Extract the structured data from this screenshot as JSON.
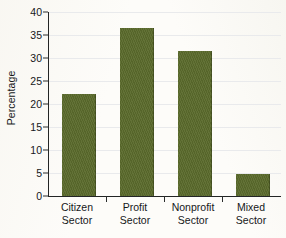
{
  "chart_data": {
    "type": "bar",
    "title": "",
    "xlabel": "",
    "ylabel": "Percentage",
    "categories": [
      "Citizen Sector",
      "Profit Sector",
      "Nonprofit Sector",
      "Mixed Sector"
    ],
    "category_lines": [
      [
        "Citizen",
        "Sector"
      ],
      [
        "Profit",
        "Sector"
      ],
      [
        "Nonprofit",
        "Sector"
      ],
      [
        "Mixed",
        "Sector"
      ]
    ],
    "values": [
      22.2,
      36.5,
      31.6,
      4.8
    ],
    "ylim": [
      0,
      40
    ],
    "ytick_values": [
      0,
      5,
      10,
      15,
      20,
      25,
      30,
      35,
      40
    ],
    "ytick_labels": [
      "0",
      "5",
      "10",
      "15",
      "20",
      "25",
      "30",
      "35",
      "40"
    ],
    "grid": true,
    "grid_axis": "y",
    "legend": "none",
    "bar_color": "#5b6a2c",
    "axis_color": "#232525",
    "gridline_color": "#e9eaec",
    "background_color": "#fdfcf9"
  }
}
